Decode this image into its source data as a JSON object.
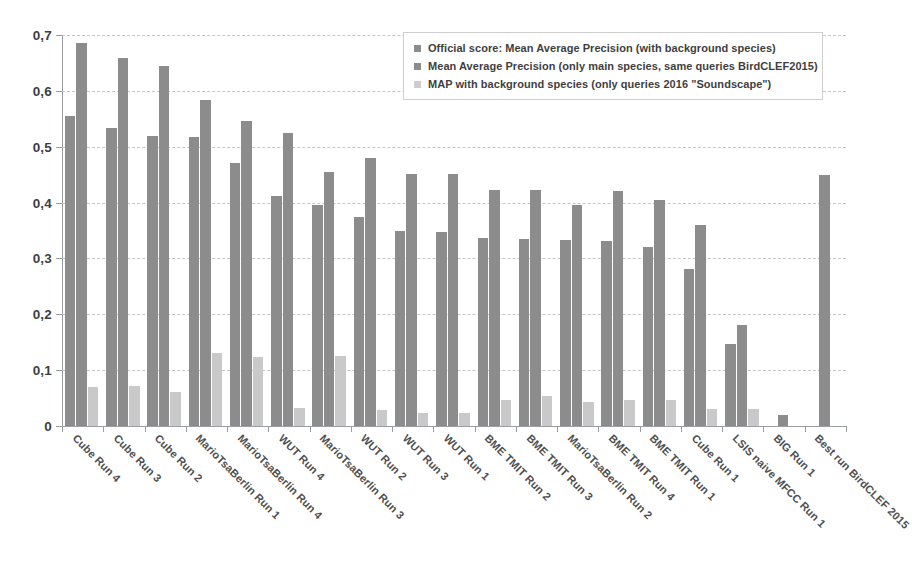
{
  "chart_data": {
    "type": "bar",
    "title": "",
    "xlabel": "",
    "ylabel": "",
    "ylim": [
      0,
      0.7
    ],
    "ytick_labels": [
      "0",
      "0,1",
      "0,2",
      "0,3",
      "0,4",
      "0,5",
      "0,6",
      "0,7"
    ],
    "ytick_values": [
      0,
      0.1,
      0.2,
      0.3,
      0.4,
      0.5,
      0.6,
      0.7
    ],
    "grid": true,
    "legend_position": "top-right",
    "decimal_separator": ",",
    "categories": [
      "Cube Run 4",
      "Cube Run 3",
      "Cube Run 2",
      "MarioTsaBerlin Run 1",
      "MarioTsaBerlin Run 4",
      "WUT Run 4",
      "MarioTsaBerlin Run 3",
      "WUT Run 2",
      "WUT Run 3",
      "WUT Run 1",
      "BME TMIT Run 2",
      "BME TMIT Run 3",
      "MarioTsaBerlin Run 2",
      "BME TMIT Run 4",
      "BME TMIT Run 1",
      "Cube Run 1",
      "LSIS naive MFCC Run 1",
      "BIG Run 1",
      "Best run BirdCLEF 2015"
    ],
    "series": [
      {
        "name": "Official score: Mean Average Precision (with background species)",
        "color": "#8c8c8c",
        "values": [
          0.555,
          0.534,
          0.519,
          0.517,
          0.47,
          0.411,
          0.396,
          0.374,
          0.349,
          0.347,
          0.337,
          0.334,
          0.333,
          0.332,
          0.32,
          0.281,
          0.146,
          0.019,
          0.45
        ]
      },
      {
        "name": "Mean Average Precision (only main species, same queries BirdCLEF2015)",
        "color": "#8c8c8c",
        "values": [
          0.685,
          0.659,
          0.645,
          0.583,
          0.546,
          0.525,
          0.454,
          0.479,
          0.452,
          0.452,
          0.422,
          0.423,
          0.396,
          0.421,
          0.405,
          0.36,
          0.18,
          null,
          null
        ]
      },
      {
        "name": "MAP with background species (only queries 2016 \"Soundscape\")",
        "color": "#cdcdcd",
        "values": [
          0.069,
          0.072,
          0.061,
          0.131,
          0.124,
          0.032,
          0.126,
          0.028,
          0.024,
          0.023,
          0.047,
          0.053,
          0.043,
          0.046,
          0.047,
          0.031,
          0.031,
          null,
          null
        ]
      }
    ]
  },
  "legend": {
    "items": [
      {
        "label": "Official score: Mean Average Precision (with background species)",
        "swatch": "series-0-swatch"
      },
      {
        "label": "Mean Average Precision (only main species, same queries BirdCLEF2015)",
        "swatch": "series-1-swatch"
      },
      {
        "label": "MAP with background species (only queries 2016 \"Soundscape\")",
        "swatch": "series-2-swatch"
      }
    ]
  }
}
